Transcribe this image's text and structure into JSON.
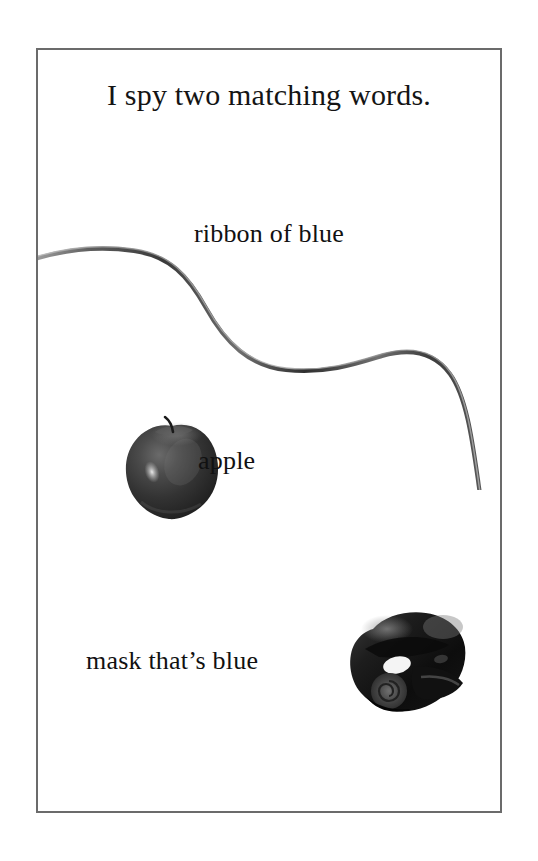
{
  "page": {
    "background_color": "#ffffff",
    "frame_border_color": "#6b6b6b",
    "text_color": "#141414"
  },
  "header": {
    "title": "I spy two matching words."
  },
  "items": [
    {
      "label": "ribbon of blue",
      "object": "ribbon",
      "object_name": "ribbon-image",
      "color_word": "blue"
    },
    {
      "label": "apple",
      "object": "apple",
      "object_name": "apple-image",
      "color_word": ""
    },
    {
      "label": "mask that’s blue",
      "object": "mask",
      "object_name": "mask-image",
      "color_word": "blue"
    }
  ]
}
